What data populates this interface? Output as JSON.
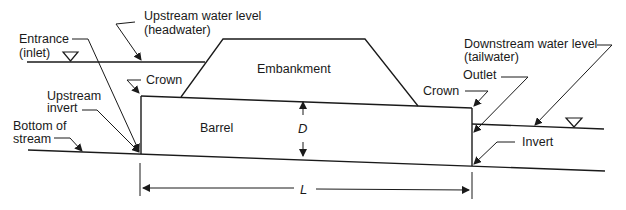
{
  "diagram": {
    "labels": {
      "entrance": [
        "Entrance",
        "(inlet)"
      ],
      "upstream_water_level": [
        "Upstream water level",
        "(headwater)"
      ],
      "downstream_water_level": [
        "Downstream water level",
        "(tailwater)"
      ],
      "crown_left": "Crown",
      "crown_right": "Crown",
      "outlet": "Outlet",
      "upstream_invert": [
        "Upstream",
        "invert"
      ],
      "bottom_of_stream": [
        "Bottom of",
        "stream"
      ],
      "embankment": "Embankment",
      "barrel": "Barrel",
      "diameter": "D",
      "invert": "Invert",
      "length": "L"
    },
    "colors": {
      "line": "#1a1a1a",
      "background": "#ffffff"
    }
  }
}
